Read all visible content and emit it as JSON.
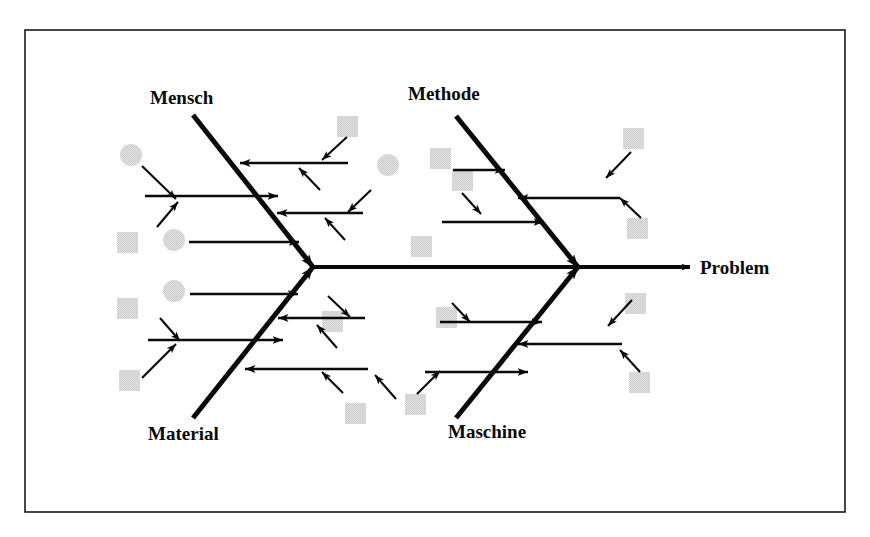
{
  "diagram": {
    "type": "ishikawa-fishbone",
    "frame": {
      "x": 25,
      "y": 30,
      "width": 820,
      "height": 482,
      "border_color": "#1a1a1a"
    },
    "background_color": "#ffffff",
    "ink_color": "#0a0a0a",
    "placeholder_fill": "#dcdcdc",
    "spine": {
      "label": "Problem",
      "start_x": 313,
      "end_x": 678,
      "y": 267,
      "head_x": 690,
      "label_x": 700,
      "label_y": 274
    },
    "bones": [
      {
        "name": "Mensch",
        "label": "Mensch",
        "position": "top-left",
        "label_x": 150,
        "label_y": 104,
        "tail_x": 193,
        "tail_y": 115,
        "head_x": 313,
        "head_y": 267
      },
      {
        "name": "Methode",
        "label": "Methode",
        "position": "top-right",
        "label_x": 408,
        "label_y": 100,
        "tail_x": 456,
        "tail_y": 116,
        "head_x": 578,
        "head_y": 267
      },
      {
        "name": "Material",
        "label": "Material",
        "position": "bottom-left",
        "label_x": 148,
        "label_y": 440,
        "tail_x": 193,
        "tail_y": 418,
        "head_x": 313,
        "head_y": 267
      },
      {
        "name": "Maschine",
        "label": "Maschine",
        "position": "bottom-right",
        "label_x": 448,
        "label_y": 438,
        "tail_x": 456,
        "tail_y": 418,
        "head_x": 578,
        "head_y": 267
      }
    ],
    "placeholder_shapes": [
      {
        "shape": "circle",
        "cx": 131,
        "cy": 155,
        "r": 11
      },
      {
        "shape": "square",
        "x": 117,
        "y": 232,
        "size": 21
      },
      {
        "shape": "circle",
        "cx": 174,
        "cy": 240,
        "r": 11
      },
      {
        "shape": "square",
        "x": 117,
        "y": 298,
        "size": 21
      },
      {
        "shape": "circle",
        "cx": 174,
        "cy": 291,
        "r": 11
      },
      {
        "shape": "square",
        "x": 119,
        "y": 370,
        "size": 21
      },
      {
        "shape": "square",
        "x": 337,
        "y": 116,
        "size": 21
      },
      {
        "shape": "circle",
        "cx": 388,
        "cy": 165,
        "r": 11
      },
      {
        "shape": "square",
        "x": 322,
        "y": 311,
        "size": 21
      },
      {
        "shape": "square",
        "x": 345,
        "y": 403,
        "size": 21
      },
      {
        "shape": "square",
        "x": 405,
        "y": 394,
        "size": 21
      },
      {
        "shape": "square",
        "x": 430,
        "y": 148,
        "size": 21
      },
      {
        "shape": "square",
        "x": 452,
        "y": 170,
        "size": 21
      },
      {
        "shape": "square",
        "x": 411,
        "y": 236,
        "size": 21
      },
      {
        "shape": "square",
        "x": 436,
        "y": 307,
        "size": 21
      },
      {
        "shape": "square",
        "x": 623,
        "y": 128,
        "size": 21
      },
      {
        "shape": "square",
        "x": 627,
        "y": 218,
        "size": 21
      },
      {
        "shape": "square",
        "x": 625,
        "y": 293,
        "size": 21
      },
      {
        "shape": "square",
        "x": 629,
        "y": 372,
        "size": 21
      }
    ],
    "sub_bones": {
      "mensch": [
        {
          "from_x": 348,
          "from_y": 163,
          "to_x": 240,
          "to_y": 163,
          "dir": "left"
        },
        {
          "from_x": 145,
          "from_y": 196,
          "to_x": 278,
          "to_y": 196,
          "dir": "right"
        },
        {
          "from_x": 363,
          "from_y": 213,
          "to_x": 277,
          "to_y": 213,
          "dir": "left"
        },
        {
          "from_x": 189,
          "from_y": 242,
          "to_x": 299,
          "to_y": 242,
          "dir": "right"
        }
      ],
      "methode": [
        {
          "from_x": 453,
          "from_y": 170,
          "to_x": 505,
          "to_y": 170,
          "dir": "right"
        },
        {
          "from_x": 620,
          "from_y": 198,
          "to_x": 518,
          "to_y": 198,
          "dir": "left"
        },
        {
          "from_x": 442,
          "from_y": 222,
          "to_x": 544,
          "to_y": 222,
          "dir": "right"
        }
      ],
      "material": [
        {
          "from_x": 148,
          "from_y": 340,
          "to_x": 283,
          "to_y": 340,
          "dir": "right"
        },
        {
          "from_x": 365,
          "from_y": 318,
          "to_x": 278,
          "to_y": 318,
          "dir": "left"
        },
        {
          "from_x": 190,
          "from_y": 294,
          "to_x": 298,
          "to_y": 294,
          "dir": "right"
        },
        {
          "from_x": 368,
          "from_y": 369,
          "to_x": 245,
          "to_y": 369,
          "dir": "left"
        }
      ],
      "maschine": [
        {
          "from_x": 440,
          "from_y": 322,
          "to_x": 542,
          "to_y": 322,
          "dir": "right"
        },
        {
          "from_x": 622,
          "from_y": 344,
          "to_x": 518,
          "to_y": 344,
          "dir": "left"
        },
        {
          "from_x": 425,
          "from_y": 372,
          "to_x": 528,
          "to_y": 372,
          "dir": "right"
        }
      ]
    },
    "feeder_arrows": [
      {
        "x1": 142,
        "y1": 166,
        "x2": 176,
        "y2": 199
      },
      {
        "x1": 157,
        "y1": 227,
        "x2": 178,
        "y2": 202
      },
      {
        "x1": 347,
        "y1": 137,
        "x2": 322,
        "y2": 160
      },
      {
        "x1": 320,
        "y1": 190,
        "x2": 299,
        "y2": 168
      },
      {
        "x1": 371,
        "y1": 190,
        "x2": 348,
        "y2": 212
      },
      {
        "x1": 345,
        "y1": 240,
        "x2": 325,
        "y2": 218
      },
      {
        "x1": 631,
        "y1": 152,
        "x2": 606,
        "y2": 178
      },
      {
        "x1": 641,
        "y1": 218,
        "x2": 620,
        "y2": 198
      },
      {
        "x1": 462,
        "y1": 193,
        "x2": 481,
        "y2": 214
      },
      {
        "x1": 417,
        "y1": 394,
        "x2": 440,
        "y2": 371
      },
      {
        "x1": 142,
        "y1": 378,
        "x2": 176,
        "y2": 344
      },
      {
        "x1": 160,
        "y1": 318,
        "x2": 180,
        "y2": 341
      },
      {
        "x1": 328,
        "y1": 296,
        "x2": 350,
        "y2": 317
      },
      {
        "x1": 337,
        "y1": 348,
        "x2": 317,
        "y2": 325
      },
      {
        "x1": 396,
        "y1": 399,
        "x2": 375,
        "y2": 375
      },
      {
        "x1": 343,
        "y1": 393,
        "x2": 322,
        "y2": 372
      },
      {
        "x1": 632,
        "y1": 300,
        "x2": 608,
        "y2": 326
      },
      {
        "x1": 640,
        "y1": 372,
        "x2": 620,
        "y2": 350
      },
      {
        "x1": 452,
        "y1": 303,
        "x2": 470,
        "y2": 322
      }
    ]
  }
}
